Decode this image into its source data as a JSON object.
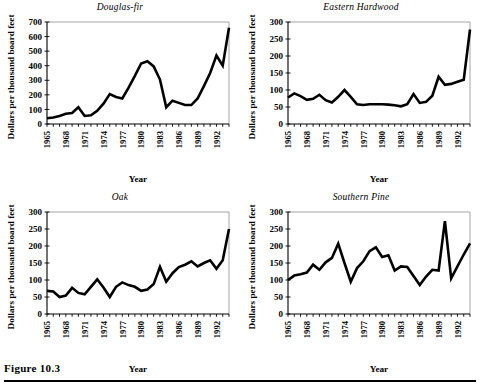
{
  "figure": {
    "caption": "Figure 10.3"
  },
  "panels": [
    {
      "id": "douglas-fir",
      "title": "Douglas-fir",
      "xlabel": "Year",
      "ylabel": "Dollars per thousand board feet"
    },
    {
      "id": "eastern-hardwood",
      "title": "Eastern Hardwood",
      "xlabel": "Year",
      "ylabel": "Dollars per thousand board feet"
    },
    {
      "id": "oak",
      "title": "Oak",
      "xlabel": "Year",
      "ylabel": "Dollars per thousand board feet"
    },
    {
      "id": "southern-pine",
      "title": "Southern Pine",
      "xlabel": "Year",
      "ylabel": "Dollars per thousand board feet"
    }
  ],
  "chart_data": [
    {
      "type": "line",
      "title": "Douglas-fir",
      "xlabel": "Year",
      "ylabel": "Dollars per thousand board feet",
      "xlim": [
        1965,
        1994
      ],
      "ylim": [
        0,
        700
      ],
      "yticks": [
        0,
        100,
        200,
        300,
        400,
        500,
        600,
        700
      ],
      "xticks": [
        1965,
        1968,
        1971,
        1974,
        1977,
        1980,
        1983,
        1986,
        1989,
        1992
      ],
      "grid": false,
      "legend": "none",
      "x": [
        1965,
        1966,
        1967,
        1968,
        1969,
        1970,
        1971,
        1972,
        1973,
        1974,
        1975,
        1976,
        1977,
        1978,
        1979,
        1980,
        1981,
        1982,
        1983,
        1984,
        1985,
        1986,
        1987,
        1988,
        1989,
        1990,
        1991,
        1992,
        1993,
        1994
      ],
      "values": [
        40,
        45,
        55,
        70,
        75,
        115,
        55,
        60,
        90,
        140,
        205,
        185,
        175,
        250,
        330,
        415,
        430,
        395,
        305,
        115,
        160,
        145,
        130,
        130,
        175,
        260,
        350,
        470,
        400,
        660
      ]
    },
    {
      "type": "line",
      "title": "Eastern Hardwood",
      "xlabel": "Year",
      "ylabel": "Dollars per thousand board feet",
      "xlim": [
        1965,
        1994
      ],
      "ylim": [
        0,
        300
      ],
      "yticks": [
        0,
        50,
        100,
        150,
        200,
        250,
        300
      ],
      "xticks": [
        1965,
        1968,
        1971,
        1974,
        1977,
        1980,
        1983,
        1986,
        1989,
        1992
      ],
      "grid": false,
      "legend": "none",
      "x": [
        1965,
        1966,
        1967,
        1968,
        1969,
        1970,
        1971,
        1972,
        1973,
        1974,
        1975,
        1976,
        1977,
        1978,
        1979,
        1980,
        1981,
        1982,
        1983,
        1984,
        1985,
        1986,
        1987,
        1988,
        1989,
        1990,
        1991,
        1992,
        1993,
        1994
      ],
      "values": [
        78,
        90,
        82,
        71,
        74,
        86,
        70,
        63,
        80,
        100,
        80,
        58,
        56,
        58,
        58,
        58,
        57,
        55,
        52,
        58,
        88,
        62,
        65,
        83,
        139,
        115,
        118,
        124,
        130,
        278
      ]
    },
    {
      "type": "line",
      "title": "Oak",
      "xlabel": "Year",
      "ylabel": "Dollars per thousand board feet",
      "xlim": [
        1965,
        1994
      ],
      "ylim": [
        0,
        300
      ],
      "yticks": [
        0,
        50,
        100,
        150,
        200,
        250,
        300
      ],
      "xticks": [
        1965,
        1968,
        1971,
        1974,
        1977,
        1980,
        1983,
        1986,
        1989,
        1992
      ],
      "grid": false,
      "legend": "none",
      "x": [
        1965,
        1966,
        1967,
        1968,
        1969,
        1970,
        1971,
        1972,
        1973,
        1974,
        1975,
        1976,
        1977,
        1978,
        1979,
        1980,
        1981,
        1982,
        1983,
        1984,
        1985,
        1986,
        1987,
        1988,
        1989,
        1990,
        1991,
        1992,
        1993,
        1994
      ],
      "values": [
        68,
        66,
        50,
        54,
        77,
        62,
        58,
        80,
        102,
        78,
        50,
        80,
        93,
        85,
        80,
        68,
        72,
        88,
        139,
        95,
        120,
        138,
        145,
        155,
        140,
        150,
        158,
        133,
        158,
        250
      ]
    },
    {
      "type": "line",
      "title": "Southern Pine",
      "xlabel": "Year",
      "ylabel": "Dollars per thousand board feet",
      "xlim": [
        1965,
        1994
      ],
      "ylim": [
        0,
        300
      ],
      "yticks": [
        0,
        50,
        100,
        150,
        200,
        250,
        300
      ],
      "xticks": [
        1965,
        1968,
        1971,
        1974,
        1977,
        1980,
        1983,
        1986,
        1989,
        1992
      ],
      "grid": false,
      "legend": "none",
      "x": [
        1965,
        1966,
        1967,
        1968,
        1969,
        1970,
        1971,
        1972,
        1973,
        1974,
        1975,
        1976,
        1977,
        1978,
        1979,
        1980,
        1981,
        1982,
        1983,
        1984,
        1985,
        1986,
        1987,
        1988,
        1989,
        1990,
        1991,
        1992,
        1993,
        1994
      ],
      "values": [
        100,
        113,
        117,
        122,
        145,
        130,
        152,
        165,
        207,
        150,
        95,
        135,
        155,
        185,
        196,
        168,
        173,
        128,
        140,
        138,
        112,
        85,
        110,
        130,
        128,
        273,
        105,
        140,
        175,
        208
      ]
    }
  ]
}
